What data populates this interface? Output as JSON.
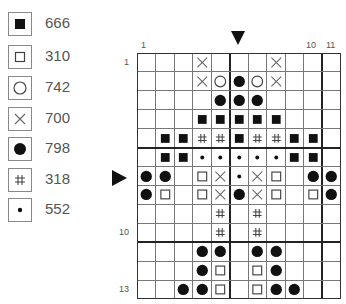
{
  "legend": [
    {
      "symbol": "filled-square",
      "code": "666"
    },
    {
      "symbol": "open-square",
      "code": "310"
    },
    {
      "symbol": "open-circle",
      "code": "742"
    },
    {
      "symbol": "cross",
      "code": "700"
    },
    {
      "symbol": "filled-circle",
      "code": "798"
    },
    {
      "symbol": "hash",
      "code": "318"
    },
    {
      "symbol": "dot",
      "code": "552"
    }
  ],
  "chart": {
    "columns": 11,
    "rows": 13,
    "column_labels": [
      {
        "col": 1,
        "text": "1"
      },
      {
        "col": 10,
        "text": "10"
      },
      {
        "col": 11,
        "text": "11"
      }
    ],
    "row_labels": [
      {
        "row": 1,
        "text": "1"
      },
      {
        "row": 10,
        "text": "10"
      },
      {
        "row": 13,
        "text": "13"
      }
    ],
    "center_markers": {
      "column": 6,
      "row": 7
    },
    "grid": [
      [
        "",
        "",
        "",
        "X",
        "",
        "",
        "",
        "X",
        "",
        "",
        ""
      ],
      [
        "",
        "",
        "",
        "X",
        "O",
        "F",
        "O",
        "X",
        "",
        "",
        ""
      ],
      [
        "",
        "",
        "",
        "",
        "F",
        "F",
        "F",
        "",
        "",
        "",
        ""
      ],
      [
        "",
        "",
        "",
        "S",
        "S",
        "S",
        "S",
        "S",
        "",
        "",
        ""
      ],
      [
        "",
        "S",
        "S",
        "H",
        "H",
        "S",
        "H",
        "H",
        "S",
        "S",
        ""
      ],
      [
        "",
        "S",
        "S",
        "D",
        "D",
        "D",
        "D",
        "D",
        "S",
        "S",
        ""
      ],
      [
        "F",
        "F",
        "",
        "Q",
        "X",
        "D",
        "X",
        "Q",
        "",
        "F",
        "F"
      ],
      [
        "F",
        "Q",
        "",
        "Q",
        "X",
        "F",
        "X",
        "Q",
        "",
        "Q",
        "F"
      ],
      [
        "",
        "",
        "",
        "",
        "H",
        "",
        "H",
        "",
        "",
        "",
        ""
      ],
      [
        "",
        "",
        "",
        "",
        "H",
        "",
        "H",
        "",
        "",
        "",
        ""
      ],
      [
        "",
        "",
        "",
        "F",
        "F",
        "",
        "F",
        "F",
        "",
        "",
        ""
      ],
      [
        "",
        "",
        "",
        "F",
        "Q",
        "",
        "Q",
        "F",
        "",
        "",
        ""
      ],
      [
        "",
        "",
        "F",
        "F",
        "Q",
        "",
        "Q",
        "F",
        "F",
        "",
        ""
      ]
    ],
    "symbol_key": {
      "S": "filled-square (666)",
      "Q": "open-square (310)",
      "O": "open-circle (742)",
      "X": "cross (700)",
      "F": "filled-circle (798)",
      "H": "hash (318)",
      "D": "dot (552)"
    }
  }
}
